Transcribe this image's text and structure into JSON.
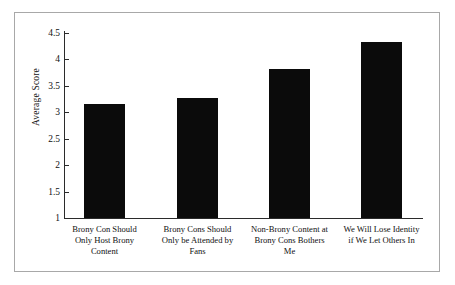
{
  "chart_data": {
    "type": "bar",
    "title": "",
    "xlabel": "",
    "ylabel": "Average Score",
    "ylim": [
      1,
      4.5
    ],
    "yticks": [
      "1",
      "1.5",
      "2",
      "2.5",
      "3",
      "3.5",
      "4",
      "4.5"
    ],
    "ytick_values": [
      1,
      1.5,
      2,
      2.5,
      3,
      3.5,
      4,
      4.5
    ],
    "grid": false,
    "legend": "none",
    "bar_color": "#0b0b0b",
    "categories": [
      "Brony Con Should Only Host Brony Content",
      "Brony Cons Should Only be Attended by Fans",
      "Non-Brony Content at Brony Cons Bothers Me",
      "We Will Lose Identity if We Let Others In"
    ],
    "category_lines": [
      [
        "Brony Con Should",
        "Only Host Brony",
        "Content"
      ],
      [
        "Brony Cons Should",
        "Only be Attended by",
        "Fans"
      ],
      [
        "Non-Brony Content at",
        "Brony Cons Bothers",
        "Me"
      ],
      [
        "We Will Lose Identity",
        "if We Let Others In",
        ""
      ]
    ],
    "values": [
      3.15,
      3.27,
      3.82,
      4.33
    ]
  }
}
